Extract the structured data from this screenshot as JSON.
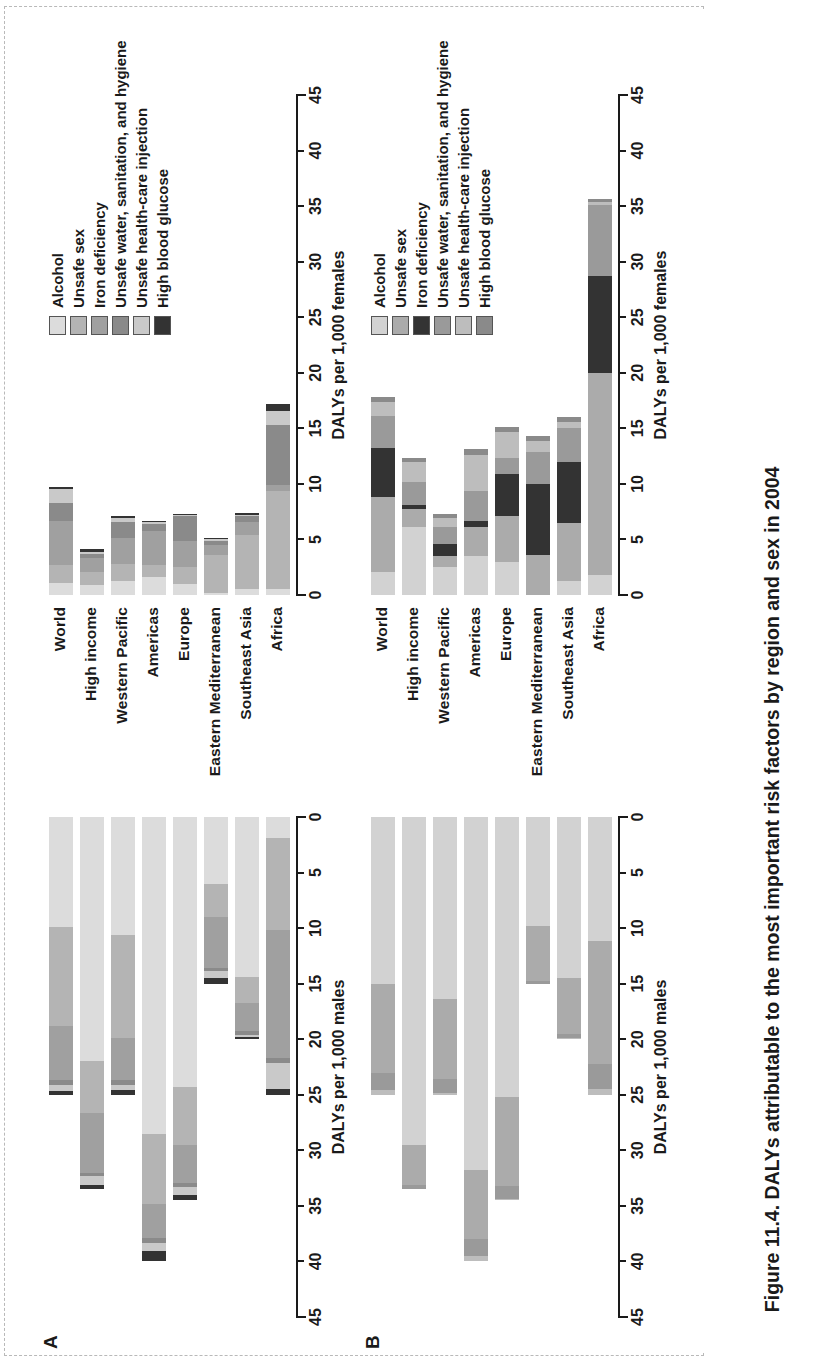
{
  "figure": {
    "caption_number": "Figure 11.4.",
    "caption_text": "DALYs attributable to the most important risk factors by region and sex in 2004"
  },
  "panels": [
    {
      "letter": "A",
      "id": "panelA"
    },
    {
      "letter": "B",
      "id": "panelB"
    }
  ],
  "legend": {
    "items": [
      {
        "label": "Alcohol",
        "colorA": "#dcdcdc",
        "colorB": "#d2d2d2"
      },
      {
        "label": "Unsafe sex",
        "colorA": "#b4b4b4",
        "colorB": "#ababab"
      },
      {
        "label": "Iron deficiency",
        "colorA": "#a0a0a0",
        "colorB": "#333333"
      },
      {
        "label": "Unsafe water, sanitation, and hygiene",
        "colorA": "#8a8a8a",
        "colorB": "#9a9a9a"
      },
      {
        "label": "Unsafe health-care injection",
        "colorA": "#c9c9c9",
        "colorB": "#bdbdbd"
      },
      {
        "label": "High blood glucose",
        "colorA": "#333333",
        "colorB": "#8a8a8a"
      }
    ]
  },
  "axes": {
    "male_title": "DALYs per 1,000 males",
    "female_title": "DALYs per 1,000 females",
    "ticks": [
      0,
      5,
      10,
      15,
      20,
      25,
      30,
      35,
      40,
      45
    ],
    "max": 45
  },
  "regions": [
    "World",
    "High income",
    "Western Pacific",
    "Americas",
    "Europe",
    "Eastern Mediterranean",
    "Southeast Asia",
    "Africa"
  ],
  "chart_data": {
    "type": "bar",
    "title": "DALYs attributable to the most important risk factors by region and sex in 2004",
    "orientation": "horizontal-paired",
    "categories": [
      "World",
      "High income",
      "Western Pacific",
      "Americas",
      "Europe",
      "Eastern Mediterranean",
      "Southeast Asia",
      "Africa"
    ],
    "series_names": [
      "Alcohol",
      "Unsafe sex",
      "Iron deficiency",
      "Unsafe water, sanitation, and hygiene",
      "Unsafe health-care injection",
      "High blood glucose"
    ],
    "xlabel_left": "DALYs per 1,000 males",
    "xlabel_right": "DALYs per 1,000 females",
    "xlim": [
      0,
      45
    ],
    "xticks": [
      0,
      5,
      10,
      15,
      20,
      25,
      30,
      35,
      40,
      45
    ],
    "grid": false,
    "legend_position": "top-right",
    "panels": [
      {
        "letter": "A",
        "note": "Panel A — upper chart",
        "male": {
          "stacks": [
            {
              "category": "World",
              "segments": [
                9.9,
                8.9,
                4.9,
                0.4,
                0.6,
                0.3
              ],
              "total": 25.0
            },
            {
              "category": "High income",
              "segments": [
                22.0,
                4.6,
                5.4,
                0.3,
                0.8,
                0.4
              ],
              "total": 33.5
            },
            {
              "category": "Western Pacific",
              "segments": [
                10.6,
                9.3,
                3.8,
                0.4,
                0.5,
                0.4
              ],
              "total": 25.0
            },
            {
              "category": "Americas",
              "segments": [
                28.5,
                6.3,
                3.1,
                0.4,
                0.8,
                0.9
              ],
              "total": 40.0
            },
            {
              "category": "Europe",
              "segments": [
                24.3,
                5.2,
                3.4,
                0.4,
                0.7,
                0.5
              ],
              "total": 34.5
            },
            {
              "category": "Eastern Mediterranean",
              "segments": [
                6.0,
                3.0,
                4.6,
                0.3,
                0.6,
                0.5
              ],
              "total": 15.0
            },
            {
              "category": "Southeast Asia",
              "segments": [
                14.4,
                2.3,
                2.6,
                0.3,
                0.2,
                0.2
              ],
              "total": 20.0
            },
            {
              "category": "Africa",
              "segments": [
                1.9,
                8.3,
                11.5,
                0.4,
                2.4,
                0.5
              ],
              "total": 25.0
            }
          ]
        },
        "female": {
          "stacks": [
            {
              "category": "World",
              "segments": [
                1.1,
                1.6,
                4.0,
                1.6,
                1.2,
                0.2
              ],
              "total": 9.7
            },
            {
              "category": "High income",
              "segments": [
                0.9,
                1.2,
                1.2,
                0.4,
                0.2,
                0.2
              ],
              "total": 4.1
            },
            {
              "category": "Western Pacific",
              "segments": [
                1.3,
                1.5,
                2.3,
                1.5,
                0.3,
                0.2
              ],
              "total": 7.1
            },
            {
              "category": "Americas",
              "segments": [
                1.6,
                1.1,
                3.1,
                0.6,
                0.2,
                0.1
              ],
              "total": 6.7
            },
            {
              "category": "Europe",
              "segments": [
                1.0,
                1.5,
                2.4,
                2.2,
                0.1,
                0.1
              ],
              "total": 7.3
            },
            {
              "category": "Eastern Mediterranean",
              "segments": [
                0.2,
                3.4,
                0.9,
                0.4,
                0.1,
                0.1
              ],
              "total": 5.1
            },
            {
              "category": "Southeast Asia",
              "segments": [
                0.5,
                4.9,
                1.2,
                0.5,
                0.1,
                0.2
              ],
              "total": 7.4
            },
            {
              "category": "Africa",
              "segments": [
                0.5,
                8.9,
                0.5,
                5.4,
                1.3,
                0.6
              ],
              "total": 17.2
            }
          ]
        }
      },
      {
        "letter": "B",
        "note": "Panel B — lower chart",
        "male": {
          "stacks": [
            {
              "category": "World",
              "segments": [
                15.0,
                8.0,
                0.0,
                1.6,
                0.4,
                0.0
              ],
              "total": 25.0
            },
            {
              "category": "High income",
              "segments": [
                29.5,
                3.6,
                0.0,
                0.4,
                0.0,
                0.0
              ],
              "total": 33.5
            },
            {
              "category": "Western Pacific",
              "segments": [
                16.4,
                7.2,
                0.0,
                1.2,
                0.2,
                0.0
              ],
              "total": 25.0
            },
            {
              "category": "Americas",
              "segments": [
                31.8,
                6.2,
                0.0,
                1.5,
                0.5,
                0.0
              ],
              "total": 40.0
            },
            {
              "category": "Europe",
              "segments": [
                25.2,
                8.0,
                0.0,
                1.2,
                0.1,
                0.0
              ],
              "total": 34.5
            },
            {
              "category": "Eastern Mediterranean",
              "segments": [
                9.8,
                5.0,
                0.0,
                0.2,
                0.0,
                0.0
              ],
              "total": 15.0
            },
            {
              "category": "Southeast Asia",
              "segments": [
                14.5,
                5.0,
                0.0,
                0.4,
                0.1,
                0.0
              ],
              "total": 20.0
            },
            {
              "category": "Africa",
              "segments": [
                11.2,
                11.0,
                0.0,
                2.3,
                0.5,
                0.0
              ],
              "total": 25.0
            }
          ]
        },
        "female": {
          "stacks": [
            {
              "category": "World",
              "segments": [
                2.1,
                6.7,
                4.4,
                2.9,
                1.3,
                0.4
              ],
              "total": 17.8
            },
            {
              "category": "High income",
              "segments": [
                6.1,
                1.6,
                0.4,
                2.1,
                1.8,
                0.3
              ],
              "total": 12.3
            },
            {
              "category": "Western Pacific",
              "segments": [
                2.5,
                1.0,
                1.1,
                1.5,
                0.8,
                0.4
              ],
              "total": 7.3
            },
            {
              "category": "Americas",
              "segments": [
                3.5,
                2.6,
                0.6,
                2.7,
                3.2,
                0.5
              ],
              "total": 13.1
            },
            {
              "category": "Europe",
              "segments": [
                3.0,
                4.1,
                3.8,
                1.4,
                2.4,
                0.4
              ],
              "total": 15.1
            },
            {
              "category": "Eastern Mediterranean",
              "segments": [
                0.0,
                3.6,
                6.4,
                2.9,
                1.0,
                0.4
              ],
              "total": 14.3
            },
            {
              "category": "Southeast Asia",
              "segments": [
                1.3,
                5.2,
                5.5,
                3.0,
                0.6,
                0.4
              ],
              "total": 16.0
            },
            {
              "category": "Africa",
              "segments": [
                1.8,
                18.2,
                8.7,
                6.4,
                0.3,
                0.2
              ],
              "total": 35.6
            }
          ]
        }
      }
    ]
  }
}
